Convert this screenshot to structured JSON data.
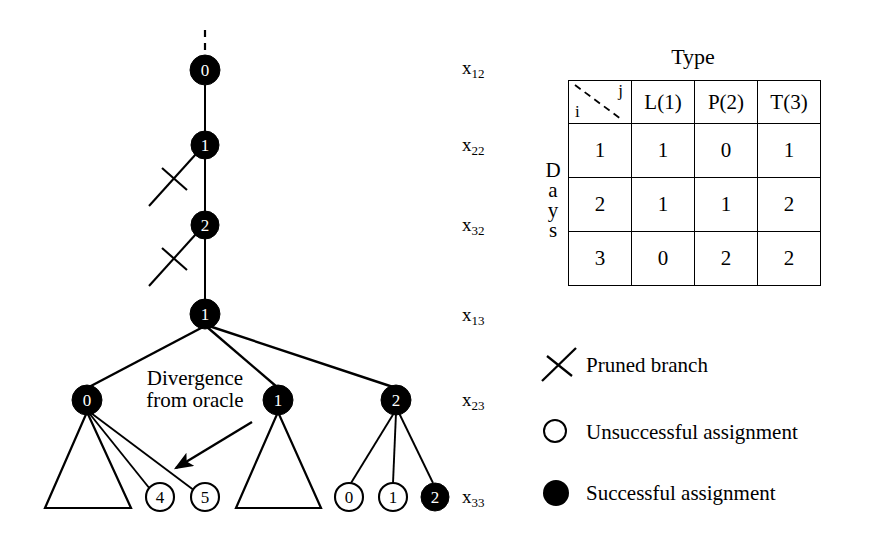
{
  "figure": {
    "tree": {
      "trunk_nodes": [
        {
          "id": "root",
          "label": "0",
          "x": 205,
          "y": 70,
          "filled": true,
          "r": 15
        },
        {
          "id": "n1",
          "label": "1",
          "x": 205,
          "y": 145,
          "filled": true,
          "r": 14
        },
        {
          "id": "n2",
          "label": "2",
          "x": 205,
          "y": 225,
          "filled": true,
          "r": 14
        },
        {
          "id": "n3",
          "label": "1",
          "x": 205,
          "y": 314,
          "filled": true,
          "r": 15
        }
      ],
      "level5_nodes": [
        {
          "id": "l5a",
          "label": "0",
          "x": 87,
          "y": 400,
          "filled": true,
          "r": 15
        },
        {
          "id": "l5b",
          "label": "1",
          "x": 278,
          "y": 400,
          "filled": true,
          "r": 15
        },
        {
          "id": "l5c",
          "label": "2",
          "x": 396,
          "y": 400,
          "filled": true,
          "r": 15
        }
      ],
      "leaf_nodes": [
        {
          "id": "leaf4",
          "label": "4",
          "x": 160,
          "y": 497,
          "filled": false,
          "r": 14
        },
        {
          "id": "leaf5",
          "label": "5",
          "x": 205,
          "y": 497,
          "filled": false,
          "r": 14
        },
        {
          "id": "leaf0",
          "label": "0",
          "x": 349,
          "y": 497,
          "filled": false,
          "r": 14
        },
        {
          "id": "leaf1",
          "label": "1",
          "x": 393,
          "y": 497,
          "filled": false,
          "r": 14
        },
        {
          "id": "leaf2",
          "label": "2",
          "x": 435,
          "y": 497,
          "filled": true,
          "r": 14
        }
      ],
      "subtree_triangles": [
        {
          "id": "tri-left",
          "apex_x": 87,
          "apex_y": 412,
          "base_left_x": 45,
          "base_right_x": 131,
          "base_y": 508
        },
        {
          "id": "tri-middle",
          "apex_x": 278,
          "apex_y": 412,
          "base_left_x": 236,
          "base_right_x": 321,
          "base_y": 508
        }
      ],
      "pruned_branches": [
        {
          "id": "prune-1",
          "x1": 196,
          "y1": 155,
          "x2": 150,
          "y2": 205,
          "cross_x": 175,
          "cross_y": 179
        },
        {
          "id": "prune-2",
          "x1": 196,
          "y1": 235,
          "x2": 150,
          "y2": 285,
          "cross_x": 175,
          "cross_y": 259
        }
      ],
      "annotation": {
        "line1": "Divergence",
        "line2": "from oracle",
        "arrow_from_x": 248,
        "arrow_from_y": 425,
        "arrow_to_x": 168,
        "arrow_to_y": 472
      }
    },
    "level_labels": [
      {
        "id": "x12",
        "base": "x",
        "sub": "12",
        "x": 462,
        "y": 58
      },
      {
        "id": "x22",
        "base": "x",
        "sub": "22",
        "x": 462,
        "y": 135
      },
      {
        "id": "x32",
        "base": "x",
        "sub": "32",
        "x": 462,
        "y": 215
      },
      {
        "id": "x13",
        "base": "x",
        "sub": "13",
        "x": 462,
        "y": 305
      },
      {
        "id": "x23",
        "base": "x",
        "sub": "23",
        "x": 462,
        "y": 390
      },
      {
        "id": "x33",
        "base": "x",
        "sub": "33",
        "x": 462,
        "y": 487
      }
    ],
    "matrix": {
      "caption": "Type",
      "row_axis_label": "Days",
      "corner": {
        "row_symbol": "i",
        "col_symbol": "j"
      },
      "columns": [
        "L(1)",
        "P(2)",
        "T(3)"
      ],
      "rows": [
        {
          "index": "1",
          "values": [
            "1",
            "0",
            "1"
          ]
        },
        {
          "index": "2",
          "values": [
            "1",
            "1",
            "2"
          ]
        },
        {
          "index": "3",
          "values": [
            "0",
            "2",
            "2"
          ]
        }
      ]
    },
    "legend": [
      {
        "id": "pruned-branch",
        "symbol": "cross-icon",
        "label": "Pruned branch",
        "y": 345
      },
      {
        "id": "unsuccessful-assignment",
        "symbol": "open-circle-icon",
        "label": "Unsuccessful assignment",
        "y": 412
      },
      {
        "id": "successful-assignment",
        "symbol": "filled-circle-icon",
        "label": "Successful assignment",
        "y": 473
      }
    ],
    "colors": {
      "ink": "#000000",
      "background": "#ffffff"
    }
  }
}
